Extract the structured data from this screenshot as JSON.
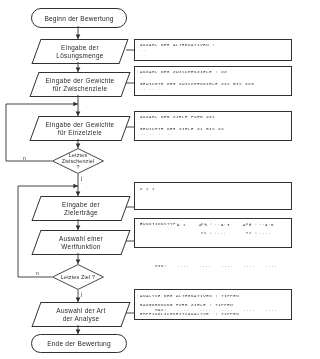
{
  "diagram": {
    "language": "de",
    "title_start": "Beginn der Bewertung",
    "title_end": "Ende der Bewertung",
    "line_color": "#2a2a2a"
  },
  "nodes": {
    "start": {
      "label": "Beginn der Bewertung",
      "shape": "terminator"
    },
    "input_solution_set": {
      "line1": "Eingabe der",
      "line2": "Lösungsmenge",
      "shape": "parallelogram"
    },
    "input_weights_sub": {
      "line1": "Eingabe der Gewichte",
      "line2": "für Zwischenziele",
      "shape": "parallelogram"
    },
    "input_weights_single": {
      "line1": "Eingabe der Gewichte",
      "line2": "für Einzelziele",
      "shape": "parallelogram"
    },
    "decision_last_sub": {
      "line1": "Letztes",
      "line2": "Zwischenziel",
      "line3": "?",
      "shape": "diamond"
    },
    "input_target_yields": {
      "line1": "Eingabe der",
      "line2": "Zielerträge",
      "shape": "parallelogram"
    },
    "select_value_function": {
      "line1": "Auswahl einer",
      "line2": "Wertfunktion",
      "shape": "parallelogram"
    },
    "decision_last_goal": {
      "line1": "Letztes Ziel ?",
      "line2": "",
      "line3": "",
      "shape": "diamond"
    },
    "select_analysis_type": {
      "line1": "Auswahl der Art",
      "line2": "der Analyse",
      "shape": "parallelogram"
    },
    "end": {
      "label": "Ende der Bewertung",
      "shape": "terminator"
    }
  },
  "branch_labels": {
    "last_sub_no": "n",
    "last_sub_yes": "j",
    "last_goal_no": "n",
    "last_goal_yes": "j"
  },
  "output_boxes": {
    "box1": {
      "lines": [
        "ANZAHL DER ALTERNATIVEN :"
      ],
      "dots": [
        ".."
      ]
    },
    "box2": {
      "lines": [
        "ANZAHL DER ZWISCHENZIELE : ZZ"
      ],
      "dots": [
        "."
      ],
      "lines2": [
        "GEWICHTE DER ZWISCHENZIELE ZZ1 BIS ZZ3"
      ],
      "dots2": [
        ".. .. .."
      ]
    },
    "box3": {
      "lines": [
        "ANZAHL DER ZIELE FUER ZZ1"
      ],
      "dots": [
        "."
      ],
      "lines2": [
        "GEWICHTE DER ZIELE Z1 BIS Z4"
      ],
      "dots2": [
        ".. .. .. .."
      ]
    },
    "box4": {
      "row_label": "Z 1 1",
      "col_headers": [
        "A 1",
        "A 2",
        "A 3",
        "A 4",
        "A 5"
      ],
      "rows": [
        {
          "name": "MIN:",
          "values": [
            "....",
            "....",
            "....",
            "....",
            "...."
          ]
        },
        {
          "name": "MAX:",
          "values": [
            "....",
            "....",
            "....",
            "....",
            "...."
          ]
        }
      ]
    },
    "box5": {
      "lines": [
        "FUNKTIONSTYP:"
      ],
      "dots": [
        "3"
      ],
      "pairs": [
        {
          "left_label": "X1 :",
          "left_value": "....",
          "right_label": "X2 :",
          "right_value": "...."
        },
        {
          "left_label": "Y1 :",
          "left_value": "....",
          "right_label": "Y2 :",
          "right_value": "...."
        }
      ]
    },
    "box6": {
      "lines": [
        "ANALYSE DER ALTERNATIVEN : TIPPEN",
        "RANGORDNUNG FUER ZIELE : TIPPEN",
        "EMPFINDLICHKEITSANALYSE  : TIPPEN"
      ]
    }
  }
}
